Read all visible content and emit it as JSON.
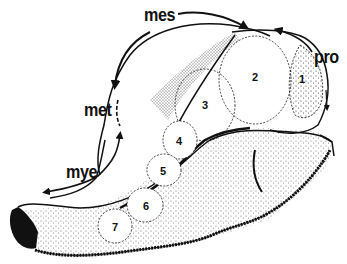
{
  "figure": {
    "type": "anatomical-diagram",
    "colors": {
      "ink": "#111111",
      "background": "#ffffff",
      "stipple": "#333333"
    }
  },
  "region_labels": [
    {
      "id": "mes",
      "text": "mes",
      "x": 144,
      "y": 7
    },
    {
      "id": "pro",
      "text": "pro",
      "x": 316,
      "y": 50
    },
    {
      "id": "met",
      "text": "met",
      "x": 84,
      "y": 103
    },
    {
      "id": "mye",
      "text": "mye",
      "x": 66,
      "y": 165
    }
  ],
  "segment_labels": [
    {
      "id": "seg1",
      "text": "1",
      "x": 299,
      "y": 74
    },
    {
      "id": "seg2",
      "text": "2",
      "x": 252,
      "y": 72
    },
    {
      "id": "seg3",
      "text": "3",
      "x": 202,
      "y": 102
    },
    {
      "id": "seg4",
      "text": "4",
      "x": 176,
      "y": 138
    },
    {
      "id": "seg5",
      "text": "5",
      "x": 160,
      "y": 170
    },
    {
      "id": "seg6",
      "text": "6",
      "x": 144,
      "y": 204
    },
    {
      "id": "seg7",
      "text": "7",
      "x": 112,
      "y": 224
    }
  ]
}
